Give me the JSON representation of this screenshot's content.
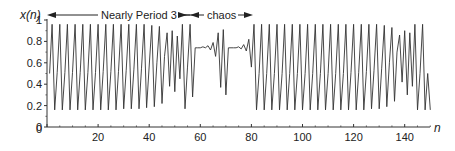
{
  "chart_data": {
    "type": "line",
    "title": "",
    "xlabel": "n",
    "ylabel": "x(n)",
    "xlim": [
      0,
      150
    ],
    "ylim": [
      0,
      1
    ],
    "grid": false,
    "legend": null,
    "x_ticks": [
      0,
      20,
      40,
      60,
      80,
      100,
      120,
      140
    ],
    "y_ticks": [
      0,
      0.2,
      0.4,
      0.6,
      0.8,
      1
    ],
    "y_tick_labels": [
      "0",
      "0.2",
      "0.4",
      "0.6",
      "0.8",
      "1"
    ],
    "annotations": [
      {
        "text": "Nearly Period 3",
        "from_n": 0,
        "to_n": 55,
        "type": "double-arrow"
      },
      {
        "text": "chaos",
        "from_n": 56,
        "to_n": 80,
        "type": "double-arrow"
      }
    ],
    "series": [
      {
        "name": "x(n)",
        "color": "#333333",
        "n_start": 1,
        "values": [
          0.5,
          0.96,
          0.16,
          0.51,
          0.96,
          0.16,
          0.51,
          0.96,
          0.16,
          0.51,
          0.96,
          0.16,
          0.51,
          0.96,
          0.16,
          0.51,
          0.96,
          0.16,
          0.51,
          0.96,
          0.16,
          0.52,
          0.96,
          0.16,
          0.52,
          0.96,
          0.16,
          0.52,
          0.96,
          0.17,
          0.53,
          0.96,
          0.17,
          0.54,
          0.96,
          0.17,
          0.55,
          0.96,
          0.18,
          0.57,
          0.95,
          0.19,
          0.6,
          0.94,
          0.22,
          0.66,
          0.88,
          0.38,
          0.9,
          0.33,
          0.85,
          0.45,
          0.96,
          0.17,
          0.56,
          0.96,
          0.28,
          0.74,
          0.74,
          0.74,
          0.75,
          0.74,
          0.76,
          0.72,
          0.79,
          0.66,
          0.88,
          0.37,
          0.91,
          0.3,
          0.74,
          0.74,
          0.74,
          0.74,
          0.75,
          0.73,
          0.77,
          0.71,
          0.82,
          0.56,
          0.96,
          0.16,
          0.5,
          0.96,
          0.16,
          0.5,
          0.96,
          0.16,
          0.5,
          0.96,
          0.16,
          0.5,
          0.96,
          0.16,
          0.5,
          0.96,
          0.16,
          0.5,
          0.96,
          0.16,
          0.5,
          0.96,
          0.16,
          0.5,
          0.96,
          0.16,
          0.5,
          0.96,
          0.16,
          0.5,
          0.96,
          0.16,
          0.5,
          0.96,
          0.16,
          0.5,
          0.96,
          0.16,
          0.51,
          0.96,
          0.16,
          0.51,
          0.96,
          0.16,
          0.52,
          0.96,
          0.17,
          0.53,
          0.96,
          0.17,
          0.55,
          0.95,
          0.19,
          0.6,
          0.93,
          0.24,
          0.7,
          0.86,
          0.42,
          0.9,
          0.3,
          0.88,
          0.38,
          0.96,
          0.16,
          0.5,
          0.96,
          0.16,
          0.5,
          0.16
        ]
      }
    ]
  },
  "labels": {
    "ylabel": "x(n)",
    "xlabel": "n",
    "annot_period3": "Nearly Period 3",
    "annot_chaos": "chaos"
  }
}
